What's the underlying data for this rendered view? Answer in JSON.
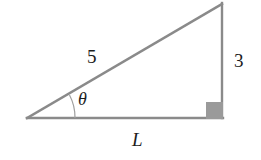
{
  "figure": {
    "name": "right-triangle-diagram",
    "background_color": "#ffffff",
    "stroke_color": "#8a8a8a",
    "fill_color": "#9a9a9a",
    "text_color": "#1c1c1c",
    "labels": {
      "hypotenuse": "5",
      "vertical_leg": "3",
      "base_leg": "L",
      "angle": "θ"
    },
    "geometry": {
      "left_vertex": [
        27,
        118
      ],
      "apex_vertex": [
        222,
        3
      ],
      "right_angle_vertex": [
        222,
        118
      ],
      "right_angle_marker": {
        "x": 206,
        "y": 102,
        "size": 17
      },
      "angle_arc": {
        "center": [
          27,
          118
        ],
        "radius": 48
      }
    }
  }
}
